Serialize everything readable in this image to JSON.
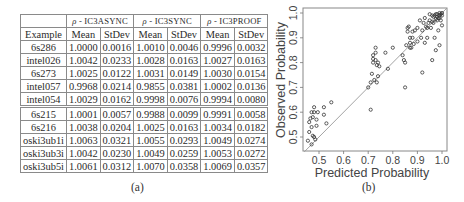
{
  "table": {
    "header_groups": [
      {
        "rho": "ρ",
        "dash": " - ",
        "name": "IC3ASYNC"
      },
      {
        "rho": "ρ",
        "dash": " - ",
        "name": "IC3SYNC"
      },
      {
        "rho": "ρ",
        "dash": " - ",
        "name": "IC3PROOF"
      }
    ],
    "column_headers": [
      "Example",
      "Mean",
      "StDev",
      "Mean",
      "StDev",
      "Mean",
      "StDev"
    ],
    "rows": [
      [
        "6s286",
        "1.0000",
        "0.0016",
        "1.0010",
        "0.0046",
        "0.9996",
        "0.0032"
      ],
      [
        "intel026",
        "1.0042",
        "0.0233",
        "1.0028",
        "0.0163",
        "1.0027",
        "0.0163"
      ],
      [
        "6s273",
        "1.0025",
        "0.0122",
        "1.0031",
        "0.0149",
        "1.0030",
        "0.0154"
      ],
      [
        "intel057",
        "0.9968",
        "0.0214",
        "0.9855",
        "0.0381",
        "1.0002",
        "0.0136"
      ],
      [
        "intel054",
        "1.0029",
        "0.0162",
        "0.9998",
        "0.0076",
        "0.9994",
        "0.0080"
      ],
      [
        "6s215",
        "1.0001",
        "0.0057",
        "0.9988",
        "0.0099",
        "0.9991",
        "0.0058"
      ],
      [
        "6s216",
        "1.0038",
        "0.0204",
        "1.0025",
        "0.0163",
        "1.0034",
        "0.0182"
      ],
      [
        "oski3ub1i",
        "1.0063",
        "0.0321",
        "1.0055",
        "0.0293",
        "1.0049",
        "0.0274"
      ],
      [
        "oski3ub3i",
        "1.0042",
        "0.0230",
        "1.0049",
        "0.0259",
        "1.0053",
        "0.0272"
      ],
      [
        "oski3ub5i",
        "1.0061",
        "0.0312",
        "1.0070",
        "0.0358",
        "1.0069",
        "0.0357"
      ]
    ],
    "separator_after_row": 4
  },
  "captions": {
    "a": "(a)",
    "b": "(b)"
  },
  "chart_data": {
    "type": "scatter",
    "title": "",
    "xlabel": "Predicted Probability",
    "ylabel": "Observed Probability",
    "xlim": [
      0.44,
      1.02
    ],
    "ylim": [
      0.44,
      1.02
    ],
    "xticks": [
      "0.5",
      "0.6",
      "0.7",
      "0.8",
      "0.9",
      "1.0"
    ],
    "yticks": [
      "0.5",
      "0.6",
      "0.7",
      "0.8",
      "0.9",
      "1.0"
    ],
    "grid": false,
    "reference_line": "y = x",
    "points": [
      [
        0.455,
        0.485
      ],
      [
        0.46,
        0.52
      ],
      [
        0.465,
        0.575
      ],
      [
        0.47,
        0.6
      ],
      [
        0.475,
        0.58
      ],
      [
        0.47,
        0.54
      ],
      [
        0.48,
        0.62
      ],
      [
        0.48,
        0.5
      ],
      [
        0.485,
        0.49
      ],
      [
        0.49,
        0.545
      ],
      [
        0.49,
        0.57
      ],
      [
        0.495,
        0.6
      ],
      [
        0.47,
        0.47
      ],
      [
        0.46,
        0.56
      ],
      [
        0.52,
        0.59
      ],
      [
        0.52,
        0.62
      ],
      [
        0.53,
        0.555
      ],
      [
        0.55,
        0.64
      ],
      [
        0.48,
        0.6
      ],
      [
        0.475,
        0.505
      ],
      [
        0.71,
        0.61
      ],
      [
        0.7,
        0.7
      ],
      [
        0.71,
        0.72
      ],
      [
        0.715,
        0.755
      ],
      [
        0.72,
        0.8
      ],
      [
        0.72,
        0.815
      ],
      [
        0.725,
        0.73
      ],
      [
        0.73,
        0.86
      ],
      [
        0.73,
        0.84
      ],
      [
        0.735,
        0.79
      ],
      [
        0.74,
        0.8
      ],
      [
        0.745,
        0.785
      ],
      [
        0.735,
        0.72
      ],
      [
        0.74,
        0.745
      ],
      [
        0.77,
        0.84
      ],
      [
        0.78,
        0.775
      ],
      [
        0.8,
        0.86
      ],
      [
        0.72,
        0.83
      ],
      [
        0.73,
        0.81
      ],
      [
        0.84,
        0.83
      ],
      [
        0.845,
        0.81
      ],
      [
        0.85,
        0.8
      ],
      [
        0.85,
        0.7
      ],
      [
        0.855,
        0.87
      ],
      [
        0.86,
        0.925
      ],
      [
        0.865,
        0.945
      ],
      [
        0.87,
        0.9
      ],
      [
        0.87,
        0.88
      ],
      [
        0.875,
        0.86
      ],
      [
        0.88,
        0.9
      ],
      [
        0.885,
        0.875
      ],
      [
        0.89,
        0.93
      ],
      [
        0.9,
        0.94
      ],
      [
        0.9,
        0.885
      ],
      [
        0.91,
        0.97
      ],
      [
        0.915,
        0.9
      ],
      [
        0.92,
        0.93
      ],
      [
        0.92,
        0.76
      ],
      [
        0.925,
        0.96
      ],
      [
        0.93,
        0.98
      ],
      [
        0.93,
        0.88
      ],
      [
        0.935,
        0.945
      ],
      [
        0.94,
        0.9
      ],
      [
        0.945,
        0.96
      ],
      [
        0.95,
        0.97
      ],
      [
        0.955,
        0.94
      ],
      [
        0.96,
        0.81
      ],
      [
        0.965,
        0.985
      ],
      [
        0.97,
        0.99
      ],
      [
        0.97,
        0.9
      ],
      [
        0.975,
        0.85
      ],
      [
        0.98,
        0.995
      ],
      [
        0.98,
        0.97
      ],
      [
        0.985,
        0.98
      ],
      [
        0.99,
        0.99
      ],
      [
        0.99,
        1.0
      ],
      [
        0.995,
        0.995
      ],
      [
        0.995,
        0.97
      ],
      [
        1.0,
        1.0
      ],
      [
        1.0,
        0.99
      ],
      [
        0.99,
        0.87
      ],
      [
        1.0,
        0.95
      ],
      [
        0.985,
        0.93
      ],
      [
        0.975,
        0.995
      ],
      [
        0.96,
        0.99
      ],
      [
        0.95,
        0.995
      ],
      [
        0.99,
        0.98
      ],
      [
        0.98,
        0.985
      ],
      [
        0.975,
        0.975
      ],
      [
        0.965,
        0.96
      ],
      [
        0.96,
        0.965
      ],
      [
        0.94,
        0.94
      ],
      [
        0.86,
        0.94
      ],
      [
        0.87,
        0.86
      ],
      [
        0.88,
        0.925
      ]
    ]
  }
}
